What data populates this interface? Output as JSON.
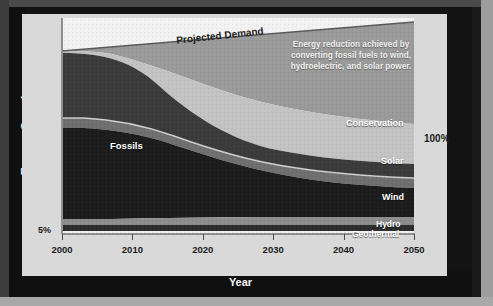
{
  "chart_data": {
    "type": "area",
    "title": "",
    "subtitle": "",
    "xlabel": "Year",
    "ylabel": "Energy Supply",
    "x": [
      2000,
      2010,
      2020,
      2030,
      2040,
      2050
    ],
    "xlim": [
      2000,
      2050
    ],
    "ylim": [
      0,
      130
    ],
    "ytick_labels": [
      "5%",
      "100%"
    ],
    "y_bottom_label": "5%",
    "y_right_label": "100%",
    "grid": false,
    "legend_position": "inline-right",
    "stacking": "stacked-area",
    "note": "Percent of total energy supply; stacked bottom-to-top. Top curve is Projected Demand.",
    "series": [
      {
        "name": "Geothermal",
        "color": "#2b2b2b",
        "values": [
          1,
          1.5,
          2,
          2.5,
          3,
          3.5
        ]
      },
      {
        "name": "Hydro",
        "color": "#8d8d8d",
        "values": [
          3,
          3.5,
          4,
          4.5,
          5,
          5.5
        ]
      },
      {
        "name": "Wind",
        "color": "#1b1b1b",
        "values": [
          1,
          4,
          12,
          24,
          31,
          35
        ]
      },
      {
        "name": "Solar",
        "color": "#6e6e6e",
        "values": [
          0.5,
          2,
          6,
          13,
          17,
          19
        ]
      },
      {
        "name": "Fossils",
        "color": "#3a3a3a",
        "values": [
          94,
          86,
          68,
          38,
          22,
          17
        ]
      },
      {
        "name": "Conservation",
        "color": "#c2c2c2",
        "values": [
          0,
          5,
          16,
          30,
          38,
          42
        ]
      },
      {
        "name": "Projected Demand",
        "color": "#9a9a9a",
        "values": [
          100,
          107,
          114,
          120,
          126,
          131
        ]
      }
    ],
    "annotations": [
      {
        "name": "projected-demand",
        "text": "Projected Demand"
      },
      {
        "name": "reduction-note",
        "text": "Energy reduction achieved by converting fossil fuels to wind, hydroelectric, and solar power."
      }
    ],
    "band_labels": {
      "fossils": "Fossils",
      "conservation": "Conservation",
      "solar": "Solar",
      "wind": "Wind",
      "hydro": "Hydro",
      "geothermal": "Geothermal"
    },
    "xtick_labels": [
      "2000",
      "2010",
      "2020",
      "2030",
      "2040",
      "2050"
    ]
  },
  "colors": {
    "frame": "#131313",
    "card": "#d9d9d9",
    "plot_white": "#f2f2f2",
    "demand_gap": "#9a9a9a"
  }
}
